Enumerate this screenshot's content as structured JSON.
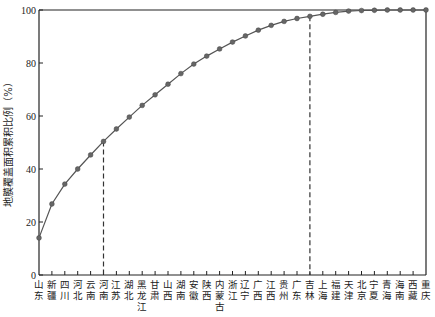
{
  "chart_data": {
    "type": "line",
    "title": "",
    "xlabel": "",
    "ylabel": "地膜覆盖面积累积比例（%）",
    "ylim": [
      0,
      100
    ],
    "yticks": [
      0,
      20,
      40,
      60,
      80,
      100
    ],
    "grid": false,
    "legend": null,
    "categories": [
      "山东",
      "新疆",
      "四川",
      "河北",
      "云南",
      "河南",
      "江苏",
      "湖北",
      "黑龙江",
      "甘肃",
      "山西",
      "湖南",
      "安徽",
      "陕西",
      "内蒙古",
      "浙江",
      "辽宁",
      "广西",
      "江西",
      "贵州",
      "广东",
      "吉林",
      "上海",
      "福建",
      "天津",
      "北京",
      "宁夏",
      "青海",
      "海南",
      "西藏",
      "重庆"
    ],
    "series": [
      {
        "name": "地膜覆盖面积累积比例",
        "values": [
          14.0,
          26.8,
          34.3,
          40.0,
          45.3,
          50.4,
          55.1,
          59.6,
          64.0,
          68.0,
          72.0,
          76.0,
          79.6,
          82.6,
          85.3,
          87.9,
          90.2,
          92.4,
          94.2,
          95.7,
          96.8,
          97.6,
          98.4,
          99.1,
          99.6,
          99.8,
          99.9,
          100.0,
          100.0,
          100.0,
          100.0
        ]
      }
    ],
    "reference_lines": [
      {
        "category": "河南",
        "value": 50.4,
        "style": "dashed"
      },
      {
        "category": "吉林",
        "value": 97.6,
        "style": "dashed"
      }
    ]
  },
  "colors": {
    "line": "#555555",
    "marker": "#666666",
    "axis": "#222222"
  }
}
